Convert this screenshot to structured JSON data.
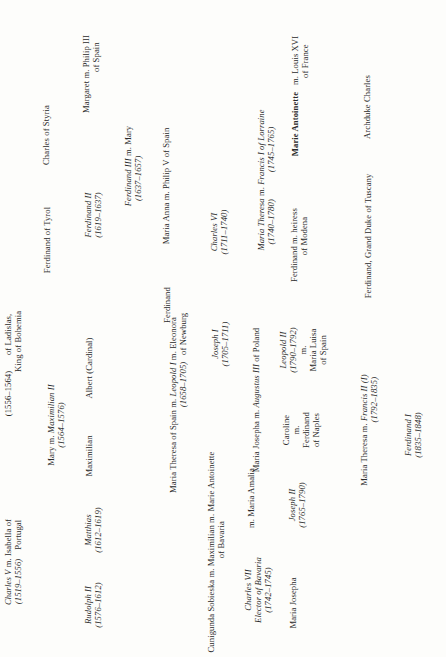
{
  "diagram": {
    "orientation": "rotated 90deg counter-clockwise",
    "nodes": [
      {
        "id": "charles-v",
        "x": 13,
        "y": 562,
        "lines": [
          "<i>Charles V</i> m. Isabella of",
          "<i>(1519–1556)</i> &nbsp;&nbsp;&nbsp;Portugal"
        ]
      },
      {
        "id": "ferdinand-i-top",
        "x": 13,
        "y": 365,
        "lines": [
          "(1556–1564) &nbsp;&nbsp;&nbsp;&nbsp;&nbsp;&nbsp;of Ladislas,",
          "&nbsp;&nbsp;&nbsp;&nbsp;&nbsp;&nbsp;&nbsp;&nbsp;&nbsp;&nbsp;&nbsp;&nbsp;&nbsp;&nbsp;&nbsp;&nbsp;&nbsp;&nbsp;&nbsp;&nbsp;&nbsp;King of Bohemia"
        ]
      },
      {
        "id": "mary-maximilian-ii",
        "x": 56,
        "y": 425,
        "lines": [
          "Mary m. <i>Maximilian II</i>",
          "<i>(1564–1576)</i>"
        ]
      },
      {
        "id": "ferdinand-of-tyrol",
        "x": 47,
        "y": 240,
        "lines": [
          "Ferdinand of Tyrol"
        ]
      },
      {
        "id": "charles-of-styria",
        "x": 46,
        "y": 135,
        "lines": [
          "Charles of Styria"
        ]
      },
      {
        "id": "rudolph-ii",
        "x": 93,
        "y": 605,
        "lines": [
          "<i>Rudolph II</i>",
          "<i>(1576–1612)</i>"
        ]
      },
      {
        "id": "matthias",
        "x": 93,
        "y": 530,
        "lines": [
          "<i>Matthias</i>",
          "<i>(1612–1619)</i>"
        ]
      },
      {
        "id": "maximilian",
        "x": 89,
        "y": 456,
        "lines": [
          "Maximilian"
        ]
      },
      {
        "id": "albert-cardinal",
        "x": 89,
        "y": 368,
        "lines": [
          "Albert (Cardinal)"
        ]
      },
      {
        "id": "ferdinand-ii",
        "x": 93,
        "y": 215,
        "lines": [
          "<i>Ferdinand II</i>",
          "<i>(1619–1637)</i>"
        ]
      },
      {
        "id": "margaret",
        "x": 91,
        "y": 74,
        "lines": [
          "Margaret m. Philip III",
          "&nbsp;&nbsp;&nbsp;&nbsp;&nbsp;&nbsp;&nbsp;&nbsp;&nbsp;&nbsp;&nbsp;&nbsp;&nbsp;&nbsp;&nbsp;of Spain"
        ]
      },
      {
        "id": "ferdinand-iii",
        "x": 133,
        "y": 166,
        "lines": [
          "<i>Ferdinand III</i> m. Mary",
          "<i>(1637–1657)</i> &nbsp;&nbsp;&nbsp;&nbsp;&nbsp;&nbsp;&nbsp;&nbsp;&nbsp;&nbsp;"
        ]
      },
      {
        "id": "leopold-i",
        "x": 178,
        "y": 405,
        "lines": [
          "Maria Theresa of Spain m. <i>Leopold I</i> m. Eleonora",
          "&nbsp;&nbsp;&nbsp;&nbsp;&nbsp;&nbsp;&nbsp;&nbsp;&nbsp;&nbsp;&nbsp;&nbsp;&nbsp;&nbsp;&nbsp;&nbsp;&nbsp;&nbsp;&nbsp;&nbsp;&nbsp;&nbsp;&nbsp;&nbsp;&nbsp;&nbsp;&nbsp;&nbsp;&nbsp;&nbsp;&nbsp;&nbsp;&nbsp;&nbsp;&nbsp;&nbsp;&nbsp;&nbsp;&nbsp;&nbsp;<i>(1658–1705)</i> &nbsp;&nbsp;of Newburg"
        ]
      },
      {
        "id": "ferdinand-son",
        "x": 167,
        "y": 305,
        "lines": [
          "Ferdinand"
        ]
      },
      {
        "id": "maria-anna",
        "x": 166,
        "y": 186,
        "lines": [
          "Maria Anna m. Philip V of Spain"
        ]
      },
      {
        "id": "cunigunda",
        "x": 216,
        "y": 552,
        "lines": [
          "Cunigunda Sobieska m. Maximilian m. Marie Antoinette",
          "&nbsp;&nbsp;&nbsp;&nbsp;&nbsp;&nbsp;&nbsp;&nbsp;&nbsp;&nbsp;&nbsp;&nbsp;&nbsp;&nbsp;&nbsp;&nbsp;&nbsp;&nbsp;&nbsp;&nbsp;&nbsp;&nbsp;&nbsp;&nbsp;&nbsp;&nbsp;&nbsp;&nbsp;&nbsp;&nbsp;&nbsp;&nbsp;&nbsp;&nbsp;&nbsp;&nbsp;&nbsp;&nbsp;&nbsp;&nbsp;&nbsp;of Bavaria &nbsp;&nbsp;&nbsp;&nbsp;&nbsp;&nbsp;&nbsp;&nbsp;&nbsp;&nbsp;&nbsp;&nbsp;&nbsp;&nbsp;&nbsp;&nbsp;&nbsp;&nbsp;&nbsp;&nbsp;&nbsp;&nbsp;&nbsp;&nbsp;&nbsp;&nbsp;&nbsp;&nbsp;&nbsp;"
        ]
      },
      {
        "id": "joseph-i",
        "x": 220,
        "y": 344,
        "lines": [
          "<i>Joseph I</i>",
          "<i>(1705–1711)</i>"
        ]
      },
      {
        "id": "charles-vi",
        "x": 219,
        "y": 232,
        "lines": [
          "<i>Charles VI</i>",
          "<i>(1711–1740)</i>"
        ]
      },
      {
        "id": "charles-vii",
        "x": 258,
        "y": 590,
        "lines": [
          "<i>Charles VII</i>",
          "<i>Elector of Bavaria</i>",
          "<i>(1742–1745)</i>"
        ]
      },
      {
        "id": "maria-amalia",
        "x": 251,
        "y": 498,
        "lines": [
          "m. Maria Amalia"
        ]
      },
      {
        "id": "maria-josepha-augustus",
        "x": 256,
        "y": 400,
        "lines": [
          "Maria Josepha m. <i>Augustus III</i> of Poland"
        ]
      },
      {
        "id": "maria-theresa",
        "x": 266,
        "y": 180,
        "lines": [
          "<i>Maria Theresa</i> m. <i>Francis I of Lorraine</i>",
          "<i>(1740–1780)</i> &nbsp;&nbsp;&nbsp;&nbsp;&nbsp;&nbsp;&nbsp;&nbsp;&nbsp;&nbsp;&nbsp;<i>(1745–1765)</i> &nbsp;&nbsp;&nbsp;&nbsp;"
        ]
      },
      {
        "id": "maria-josepha",
        "x": 293,
        "y": 603,
        "lines": [
          "Maria Josepha"
        ]
      },
      {
        "id": "joseph-ii",
        "x": 297,
        "y": 505,
        "lines": [
          "<i>Joseph II</i>",
          "<i>(1765–1790)</i>"
        ]
      },
      {
        "id": "caroline",
        "x": 301,
        "y": 430,
        "lines": [
          "Caroline",
          "m.",
          "Ferdinand",
          "of Naples"
        ]
      },
      {
        "id": "leopold-ii",
        "x": 303,
        "y": 350,
        "lines": [
          "<i>Leopold II</i>",
          "<i>(1790–1792)</i>",
          "m.",
          "Maria Luisa",
          "of Spain"
        ]
      },
      {
        "id": "ferdinand-modena",
        "x": 299,
        "y": 245,
        "lines": [
          "Ferdinand m. heiress",
          "&nbsp;&nbsp;&nbsp;&nbsp;&nbsp;&nbsp;&nbsp;&nbsp;of Modena"
        ]
      },
      {
        "id": "marie-antoinette",
        "x": 300,
        "y": 96,
        "lines": [
          "<b>Marie Antoinette</b> &nbsp;&nbsp;m. Louis XVI",
          "&nbsp;&nbsp;&nbsp;&nbsp;&nbsp;&nbsp;&nbsp;&nbsp;&nbsp;&nbsp;&nbsp;&nbsp;&nbsp;&nbsp;&nbsp;&nbsp;&nbsp;&nbsp;&nbsp;&nbsp;&nbsp;&nbsp;&nbsp;&nbsp;&nbsp;&nbsp;&nbsp;&nbsp;&nbsp;&nbsp;&nbsp;of France"
        ]
      },
      {
        "id": "francis-ii",
        "x": 369,
        "y": 430,
        "lines": [
          "Maria Theresa m. <i>Francis II (I)</i>",
          "&nbsp;&nbsp;&nbsp;&nbsp;&nbsp;&nbsp;&nbsp;&nbsp;&nbsp;&nbsp;&nbsp;&nbsp;&nbsp;&nbsp;&nbsp;&nbsp;&nbsp;&nbsp;&nbsp;&nbsp;&nbsp;&nbsp;&nbsp;&nbsp;&nbsp;&nbsp;&nbsp;<i>(1792–1835)</i>"
        ]
      },
      {
        "id": "ferdinand-tuscany",
        "x": 368,
        "y": 236,
        "lines": [
          "Ferdinand, Grand Duke of Tuscany"
        ]
      },
      {
        "id": "archduke-charles",
        "x": 367,
        "y": 107,
        "lines": [
          "Archduke Charles"
        ]
      },
      {
        "id": "ferdinand-i-emperor",
        "x": 413,
        "y": 435,
        "lines": [
          "<i>Ferdinand I</i>",
          "<i>(1835–1848)</i>"
        ]
      }
    ],
    "hlines": [
      [
        20,
        33,
        385,
        14
      ],
      [
        31,
        45,
        384,
        13
      ],
      [
        32,
        141,
        389,
        13
      ],
      [
        31,
        145,
        200,
        13
      ],
      [
        31,
        143,
        97,
        13
      ],
      [
        72,
        95,
        300,
        12
      ],
      [
        72,
        97,
        205,
        9
      ],
      [
        72,
        97,
        143,
        10
      ],
      [
        72,
        95,
        73,
        14
      ],
      [
        60,
        65,
        456,
        11
      ],
      [
        60,
        66,
        405,
        9
      ],
      [
        75,
        105,
        420,
        13
      ],
      [
        68,
        74,
        200,
        14
      ],
      [
        106,
        118,
        126,
        10
      ],
      [
        114,
        120,
        143,
        22
      ],
      [
        144,
        150,
        180,
        10
      ],
      [
        137,
        149,
        263,
        13
      ],
      [
        138,
        154,
        432,
        10
      ],
      [
        188,
        194,
        455,
        10
      ],
      [
        188,
        208,
        222,
        10
      ],
      [
        191,
        210,
        282,
        13
      ],
      [
        196,
        210,
        380,
        10
      ],
      [
        215,
        220,
        285,
        14
      ],
      [
        215,
        220,
        291,
        9
      ],
      [
        228,
        234,
        235,
        10
      ],
      [
        229,
        240,
        372,
        14
      ],
      [
        263,
        275,
        505,
        17
      ],
      [
        275,
        291,
        525,
        13
      ],
      [
        270,
        282,
        443,
        10
      ],
      [
        266,
        291,
        310,
        10
      ],
      [
        266,
        283,
        355,
        13
      ],
      [
        266,
        281,
        262,
        10
      ],
      [
        262,
        273,
        109,
        13
      ],
      [
        304,
        330,
        508,
        14
      ],
      [
        308,
        318,
        344,
        13
      ],
      [
        305,
        313,
        458,
        14
      ],
      [
        308,
        318,
        405,
        12
      ],
      [
        335,
        348,
        420,
        12
      ],
      [
        340,
        350,
        485,
        17
      ],
      [
        375,
        392,
        452,
        18
      ],
      [
        340,
        352,
        363,
        13
      ]
    ],
    "vlines": [
      [
        31,
        109,
        385
      ],
      [
        30,
        143,
        445
      ],
      [
        96,
        55,
        345
      ],
      [
        71,
        101,
        605
      ],
      [
        90,
        116,
        143
      ],
      [
        65,
        152,
        456
      ],
      [
        66,
        135,
        283
      ],
      [
        150,
        166,
        455
      ],
      [
        194,
        154,
        451
      ],
      [
        214,
        175,
        234
      ],
      [
        210,
        166,
        380
      ],
      [
        255,
        152,
        260
      ],
      [
        274,
        109,
        420
      ],
      [
        292,
        270,
        350
      ],
      [
        281,
        265,
        300
      ],
      [
        330,
        413,
        510
      ],
      [
        329,
        463,
        505
      ],
      [
        385,
        343,
        460
      ]
    ]
  }
}
